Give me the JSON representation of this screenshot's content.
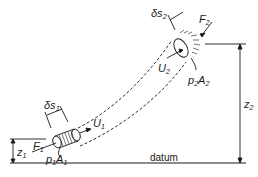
{
  "diagram": {
    "type": "stream-tube-energy",
    "labels": {
      "delta_s1": "δs",
      "delta_s1_sub": "1",
      "delta_s2": "δs",
      "delta_s2_sub": "2",
      "F1": "F",
      "F1_sub": "1",
      "F2": "F",
      "F2_sub": "2",
      "U1": "U",
      "U1_sub": "1",
      "U2": "U",
      "U2_sub": "2",
      "p1": "p",
      "p1_sub": "1",
      "A1": "A",
      "A1_sub": "1",
      "p2": "p",
      "p2_sub": "2",
      "A2": "A",
      "A2_sub": "2",
      "z1": "z",
      "z1_sub": "1",
      "z2": "z",
      "z2_sub": "2",
      "datum": "datum"
    },
    "colors": {
      "ink": "#1a1a1a",
      "background": "#ffffff"
    }
  }
}
